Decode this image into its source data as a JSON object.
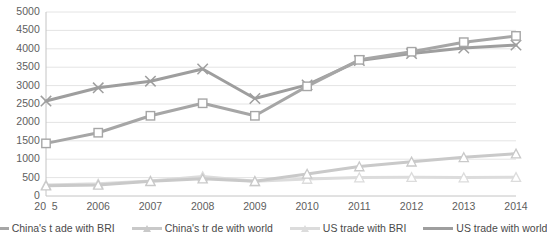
{
  "chart_data": {
    "type": "line",
    "title": "",
    "xlabel": "",
    "ylabel": "",
    "ylim": [
      0,
      5000
    ],
    "ytick_step": 500,
    "grid": true,
    "legend_position": "bottom",
    "categories": [
      "2005",
      "2006",
      "2007",
      "2008",
      "2009",
      "2010",
      "2011",
      "2012",
      "2013",
      "2014"
    ],
    "xtick_labels": [
      "20 5",
      "2006",
      "2007",
      "2008",
      "2009",
      "2010",
      "2011",
      "2012",
      "2013",
      "2014"
    ],
    "ytick_labels": [
      "0",
      "500",
      "1000",
      "1500",
      "2000",
      "2500",
      "3000",
      "3500",
      "4000",
      "4500",
      "5000"
    ],
    "series": [
      {
        "name": "China's trade with BRI",
        "color": "#a6a6a6",
        "marker": "square",
        "values": [
          1430,
          1720,
          2180,
          2520,
          2180,
          2980,
          3700,
          3920,
          4180,
          4350
        ]
      },
      {
        "name": "China's trade with world",
        "color": "#c9c9c9",
        "marker": "triangle",
        "values": [
          280,
          300,
          400,
          470,
          400,
          600,
          800,
          930,
          1050,
          1150
        ]
      },
      {
        "name": "US trade with BRI",
        "color": "#dcdcdc",
        "marker": "triangle-open",
        "values": [
          300,
          330,
          410,
          530,
          400,
          460,
          500,
          510,
          500,
          510
        ]
      },
      {
        "name": "US trade with world",
        "color": "#9e9e9e",
        "marker": "x",
        "values": [
          2580,
          2940,
          3120,
          3450,
          2650,
          3020,
          3680,
          3870,
          4020,
          4100
        ]
      }
    ]
  },
  "legend": {
    "items": [
      {
        "label": "China's t ade with BRI"
      },
      {
        "label": "China's tr de with world"
      },
      {
        "label": "US trade with BRI"
      },
      {
        "label": "US trade with world"
      }
    ]
  },
  "axis": {
    "first_xtick_prefix": "20",
    "first_xtick_faded": "0",
    "first_xtick_suffix": "5"
  }
}
